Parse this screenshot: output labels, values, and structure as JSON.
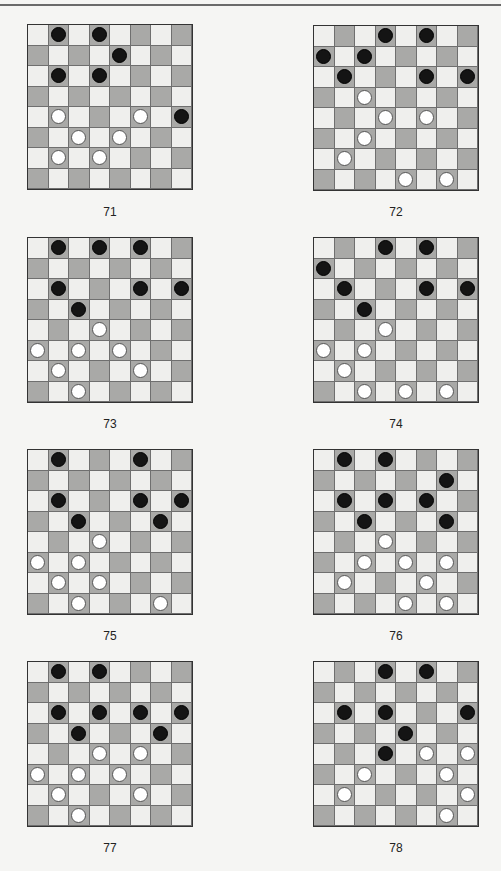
{
  "page": {
    "header_text": ""
  },
  "colors": {
    "light_square": "#efefed",
    "dark_square": "#a9a9a7",
    "black_piece": "#141414",
    "white_piece": "#ffffff"
  },
  "diagrams": [
    {
      "number": "71",
      "black": [
        [
          0,
          1
        ],
        [
          0,
          3
        ],
        [
          1,
          4
        ],
        [
          2,
          1
        ],
        [
          2,
          3
        ],
        [
          4,
          7
        ]
      ],
      "white": [
        [
          4,
          1
        ],
        [
          4,
          5
        ],
        [
          5,
          2
        ],
        [
          5,
          4
        ],
        [
          6,
          1
        ],
        [
          6,
          3
        ]
      ]
    },
    {
      "number": "72",
      "black": [
        [
          0,
          3
        ],
        [
          0,
          5
        ],
        [
          1,
          0
        ],
        [
          1,
          2
        ],
        [
          2,
          1
        ],
        [
          2,
          5
        ],
        [
          2,
          7
        ]
      ],
      "white": [
        [
          3,
          2
        ],
        [
          4,
          3
        ],
        [
          4,
          5
        ],
        [
          5,
          2
        ],
        [
          6,
          1
        ],
        [
          7,
          4
        ],
        [
          7,
          6
        ]
      ]
    },
    {
      "number": "73",
      "black": [
        [
          0,
          1
        ],
        [
          0,
          3
        ],
        [
          0,
          5
        ],
        [
          2,
          1
        ],
        [
          2,
          5
        ],
        [
          2,
          7
        ],
        [
          3,
          2
        ]
      ],
      "white": [
        [
          4,
          3
        ],
        [
          5,
          0
        ],
        [
          5,
          2
        ],
        [
          5,
          4
        ],
        [
          6,
          1
        ],
        [
          6,
          5
        ],
        [
          7,
          2
        ]
      ]
    },
    {
      "number": "74",
      "black": [
        [
          0,
          3
        ],
        [
          0,
          5
        ],
        [
          1,
          0
        ],
        [
          2,
          1
        ],
        [
          2,
          5
        ],
        [
          2,
          7
        ],
        [
          3,
          2
        ]
      ],
      "white": [
        [
          4,
          3
        ],
        [
          5,
          0
        ],
        [
          5,
          2
        ],
        [
          6,
          1
        ],
        [
          7,
          2
        ],
        [
          7,
          4
        ],
        [
          7,
          6
        ]
      ]
    },
    {
      "number": "75",
      "black": [
        [
          0,
          1
        ],
        [
          0,
          5
        ],
        [
          2,
          1
        ],
        [
          2,
          5
        ],
        [
          2,
          7
        ],
        [
          3,
          2
        ],
        [
          3,
          6
        ]
      ],
      "white": [
        [
          4,
          3
        ],
        [
          5,
          0
        ],
        [
          5,
          2
        ],
        [
          6,
          1
        ],
        [
          6,
          3
        ],
        [
          7,
          2
        ],
        [
          7,
          6
        ]
      ]
    },
    {
      "number": "76",
      "black": [
        [
          0,
          1
        ],
        [
          0,
          3
        ],
        [
          1,
          6
        ],
        [
          2,
          1
        ],
        [
          2,
          3
        ],
        [
          2,
          5
        ],
        [
          3,
          2
        ],
        [
          3,
          6
        ]
      ],
      "white": [
        [
          4,
          3
        ],
        [
          5,
          2
        ],
        [
          5,
          4
        ],
        [
          5,
          6
        ],
        [
          6,
          1
        ],
        [
          6,
          5
        ],
        [
          7,
          4
        ],
        [
          7,
          6
        ]
      ]
    },
    {
      "number": "77",
      "black": [
        [
          0,
          1
        ],
        [
          0,
          3
        ],
        [
          2,
          1
        ],
        [
          2,
          3
        ],
        [
          2,
          5
        ],
        [
          2,
          7
        ],
        [
          3,
          2
        ],
        [
          3,
          6
        ]
      ],
      "white": [
        [
          4,
          3
        ],
        [
          4,
          5
        ],
        [
          5,
          0
        ],
        [
          5,
          2
        ],
        [
          5,
          4
        ],
        [
          6,
          1
        ],
        [
          6,
          5
        ],
        [
          7,
          2
        ]
      ]
    },
    {
      "number": "78",
      "black": [
        [
          0,
          3
        ],
        [
          0,
          5
        ],
        [
          2,
          1
        ],
        [
          2,
          3
        ],
        [
          2,
          7
        ],
        [
          3,
          4
        ],
        [
          4,
          3
        ]
      ],
      "white": [
        [
          4,
          5
        ],
        [
          4,
          7
        ],
        [
          5,
          2
        ],
        [
          5,
          6
        ],
        [
          6,
          1
        ],
        [
          6,
          7
        ],
        [
          7,
          6
        ]
      ]
    }
  ]
}
